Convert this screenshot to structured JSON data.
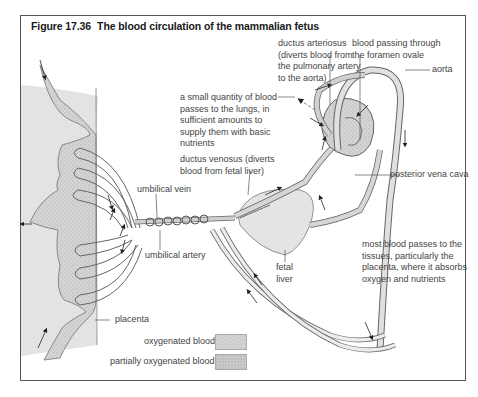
{
  "figure": {
    "number": "Figure 17.36",
    "title": "The blood circulation of the mammalian fetus"
  },
  "labels": {
    "ductus_arteriosus": [
      "ductus arteriosus",
      "(diverts blood from",
      "the pulmonary artery",
      "to the aorta)"
    ],
    "foramen_ovale": [
      "blood passing through",
      "the foramen ovale"
    ],
    "aorta": "aorta",
    "lungs": [
      "a small quantity of blood",
      "passes to the lungs, in",
      "sufficient amounts to",
      "supply them with basic",
      "nutrients"
    ],
    "ductus_venosus": [
      "ductus venosus (diverts",
      "blood from fetal liver)"
    ],
    "posterior_vena_cava": "posterior vena cava",
    "umbilical_vein": "umbilical vein",
    "umbilical_artery": "umbilical artery",
    "fetal_liver": [
      "fetal",
      "liver"
    ],
    "tissues": [
      "most blood passes to the",
      "tissues, particularly the",
      "placenta, where it absorbs",
      "oxygen and nutrients"
    ],
    "placenta": "placenta"
  },
  "legend": [
    {
      "label": "oxygenated blood",
      "color": "#d9d9d9"
    },
    {
      "label": "partially oxygenated blood",
      "color": "#c8c8c8"
    }
  ],
  "colors": {
    "maternal_tissue": "#e2e2e2",
    "blood_sinus": "#cfcfcf",
    "vessel_fill": "#d6d6d6",
    "liver": "#e4e4e4",
    "outline": "#555555"
  }
}
